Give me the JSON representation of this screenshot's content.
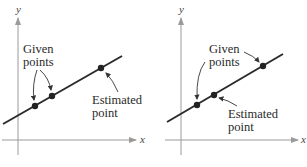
{
  "figure": {
    "panels": [
      {
        "id": "left",
        "x_axis_label": "x",
        "y_axis_label": "y",
        "given_label_line1": "Given",
        "given_label_line2": "points",
        "estimated_label_line1": "Estimated",
        "estimated_label_line2": "point",
        "description": "Extrapolation: estimated point lies outside the given points"
      },
      {
        "id": "right",
        "x_axis_label": "x",
        "y_axis_label": "y",
        "given_label_line1": "Given",
        "given_label_line2": "points",
        "estimated_label_line1": "Estimated",
        "estimated_label_line2": "point",
        "description": "Interpolation: estimated point lies between the given points"
      }
    ],
    "colors": {
      "line": "#2b2b2b",
      "axis": "#9a9a9a",
      "point": "#222222",
      "text": "#2a2a2a"
    }
  }
}
